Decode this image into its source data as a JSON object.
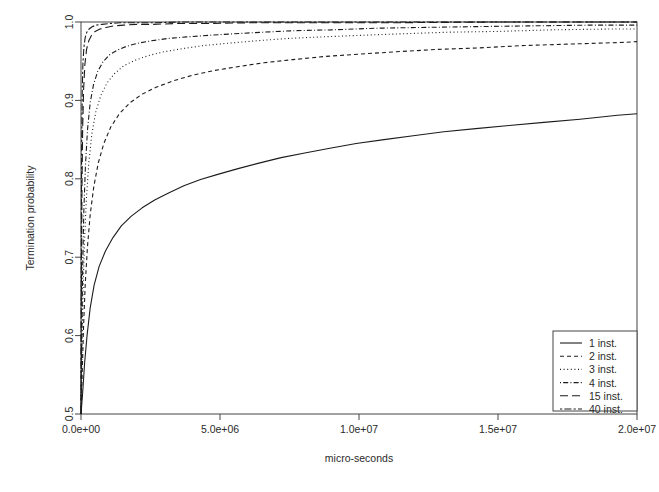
{
  "chart_data": {
    "type": "line",
    "title": "",
    "xlabel": "micro-seconds",
    "ylabel": "Termination probability",
    "xlim": [
      0,
      20000000
    ],
    "ylim": [
      0.5,
      1.0
    ],
    "grid": false,
    "legend_position": "bottom-right",
    "xticks": [
      0,
      5000000,
      10000000,
      15000000,
      20000000
    ],
    "xticklabels": [
      "0.0e+00",
      "5.0e+06",
      "1.0e+07",
      "1.5e+07",
      "2.0e+07"
    ],
    "yticks": [
      0.5,
      0.6,
      0.7,
      0.8,
      0.9,
      1.0
    ],
    "yticklabels": [
      "0.5",
      "0.6",
      "0.7",
      "0.8",
      "0.9",
      "1.0"
    ],
    "series": [
      {
        "name": "1 inst.",
        "label": "1 inst.",
        "dash": "none",
        "x": [
          0,
          60000,
          130000,
          220000,
          330000,
          470000,
          650000,
          880000,
          1150000,
          1450000,
          1800000,
          2200000,
          2650000,
          3150000,
          3700000,
          4300000,
          4950000,
          5650000,
          6400000,
          7200000,
          8050000,
          8950000,
          9900000,
          10900000,
          11950000,
          13050000,
          14200000,
          15400000,
          16650000,
          17950000,
          19300000,
          20000000
        ],
        "y": [
          0.5,
          0.527,
          0.565,
          0.601,
          0.635,
          0.664,
          0.688,
          0.708,
          0.725,
          0.74,
          0.752,
          0.763,
          0.773,
          0.782,
          0.791,
          0.799,
          0.806,
          0.813,
          0.82,
          0.827,
          0.833,
          0.839,
          0.845,
          0.85,
          0.855,
          0.86,
          0.864,
          0.868,
          0.872,
          0.876,
          0.881,
          0.883
        ]
      },
      {
        "name": "2 inst.",
        "label": "2 inst.",
        "dash": "dashed",
        "x": [
          0,
          40000,
          90000,
          150000,
          230000,
          330000,
          460000,
          620000,
          820000,
          1070000,
          1380000,
          1760000,
          2200000,
          2720000,
          3320000,
          4000000,
          4770000,
          5630000,
          6580000,
          7620000,
          8760000,
          10000000,
          11340000,
          12780000,
          14320000,
          15960000,
          17700000,
          19540000,
          20000000
        ],
        "y": [
          0.5,
          0.548,
          0.609,
          0.664,
          0.712,
          0.754,
          0.79,
          0.82,
          0.845,
          0.866,
          0.883,
          0.897,
          0.908,
          0.917,
          0.925,
          0.932,
          0.938,
          0.943,
          0.948,
          0.952,
          0.956,
          0.959,
          0.962,
          0.965,
          0.967,
          0.97,
          0.972,
          0.974,
          0.975
        ]
      },
      {
        "name": "3 inst.",
        "label": "3 inst.",
        "dash": "dotted",
        "x": [
          0,
          30000,
          70000,
          120000,
          190000,
          280000,
          390000,
          530000,
          710000,
          930000,
          1200000,
          1530000,
          1930000,
          2410000,
          2980000,
          3650000,
          4420000,
          5300000,
          6300000,
          7420000,
          8670000,
          10050000,
          11560000,
          13210000,
          15000000,
          16930000,
          19000000,
          20000000
        ],
        "y": [
          0.5,
          0.568,
          0.649,
          0.715,
          0.772,
          0.82,
          0.857,
          0.885,
          0.906,
          0.922,
          0.934,
          0.944,
          0.951,
          0.957,
          0.962,
          0.966,
          0.97,
          0.973,
          0.976,
          0.979,
          0.981,
          0.983,
          0.985,
          0.987,
          0.988,
          0.99,
          0.991,
          0.991
        ]
      },
      {
        "name": "4 inst.",
        "label": "4 inst.",
        "dash": "dashdot",
        "x": [
          0,
          25000,
          60000,
          100000,
          160000,
          235000,
          330000,
          450000,
          600000,
          790000,
          1020000,
          1300000,
          1640000,
          2050000,
          2540000,
          3120000,
          3800000,
          4590000,
          5500000,
          6540000,
          7720000,
          9050000,
          10540000,
          12200000,
          14030000,
          16050000,
          18250000,
          20000000
        ],
        "y": [
          0.5,
          0.589,
          0.684,
          0.757,
          0.817,
          0.863,
          0.897,
          0.92,
          0.937,
          0.949,
          0.958,
          0.964,
          0.969,
          0.973,
          0.976,
          0.979,
          0.981,
          0.983,
          0.985,
          0.987,
          0.989,
          0.99,
          0.992,
          0.993,
          0.994,
          0.995,
          0.996,
          0.996
        ]
      },
      {
        "name": "15 inst.",
        "label": "15 inst.",
        "dash": "longdash",
        "x": [
          0,
          15000,
          35000,
          60000,
          95000,
          140000,
          200000,
          280000,
          380000,
          510000,
          680000,
          900000,
          1180000,
          1540000,
          2000000,
          2600000,
          3400000,
          4500000,
          6000000,
          8000000,
          11000000,
          15000000,
          20000000
        ],
        "y": [
          0.5,
          0.665,
          0.79,
          0.865,
          0.915,
          0.946,
          0.965,
          0.976,
          0.983,
          0.988,
          0.991,
          0.993,
          0.995,
          0.996,
          0.997,
          0.997,
          0.998,
          0.998,
          0.999,
          0.999,
          0.999,
          1.0,
          1.0
        ]
      },
      {
        "name": "40 inst.",
        "label": "40 inst.",
        "dash": "twodash",
        "x": [
          0,
          10000,
          25000,
          45000,
          70000,
          105000,
          150000,
          210000,
          290000,
          400000,
          550000,
          750000,
          1020000,
          1400000,
          1900000,
          2600000,
          3600000,
          5000000,
          7200000,
          10500000,
          15000000,
          20000000
        ],
        "y": [
          0.5,
          0.72,
          0.845,
          0.912,
          0.948,
          0.968,
          0.98,
          0.987,
          0.991,
          0.994,
          0.996,
          0.997,
          0.998,
          0.999,
          0.999,
          0.999,
          1.0,
          1.0,
          1.0,
          1.0,
          1.0,
          1.0
        ]
      }
    ]
  },
  "plot_geometry": {
    "left": 81,
    "right": 637,
    "top": 22,
    "bottom": 414
  },
  "legend": {
    "box": {
      "x": 553,
      "y": 331,
      "width": 84,
      "height": 80
    }
  },
  "colors": {
    "line": "#1c1c1c",
    "frame": "#444444",
    "background": "#ffffff"
  }
}
